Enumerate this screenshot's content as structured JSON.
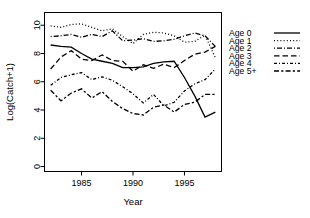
{
  "chart_data": {
    "type": "line",
    "title": "",
    "xlabel": "Year",
    "ylabel": "Log(Catch+1)",
    "xlim": [
      1981.4,
      1998.6
    ],
    "ylim": [
      -0.35,
      10.9
    ],
    "xticks": [
      1985,
      1990,
      1995
    ],
    "xtick_labels": [
      "1985",
      "1990",
      "1995"
    ],
    "yticks": [
      0,
      2,
      4,
      6,
      8,
      10
    ],
    "ytick_labels": [
      "0",
      "2",
      "4",
      "6",
      "8",
      "10"
    ],
    "grid": false,
    "legend_position": "right",
    "x": [
      1982,
      1983,
      1984,
      1985,
      1986,
      1987,
      1988,
      1989,
      1990,
      1991,
      1992,
      1993,
      1994,
      1995,
      1996,
      1997,
      1998
    ],
    "series": [
      {
        "name": "Age 0",
        "dash": "solid",
        "values": [
          8.6,
          8.5,
          8.45,
          8.0,
          7.6,
          7.45,
          7.3,
          7.0,
          7.0,
          7.05,
          7.3,
          7.4,
          7.45,
          6.3,
          5.0,
          3.5,
          3.85
        ]
      },
      {
        "name": "Age 1",
        "dash": "dotted",
        "values": [
          9.95,
          9.85,
          10.05,
          10.1,
          9.85,
          9.6,
          9.75,
          9.2,
          8.7,
          9.35,
          9.5,
          9.45,
          9.25,
          8.8,
          8.85,
          9.3,
          7.7
        ]
      },
      {
        "name": "Age 2",
        "dash": "dashdot",
        "values": [
          9.2,
          9.25,
          9.35,
          9.15,
          9.35,
          9.2,
          9.6,
          8.9,
          8.95,
          9.05,
          8.85,
          8.9,
          9.0,
          9.25,
          9.45,
          9.25,
          8.5
        ]
      },
      {
        "name": "Age 3",
        "dash": "dashed",
        "values": [
          6.9,
          7.75,
          8.2,
          7.6,
          7.5,
          7.9,
          7.5,
          7.45,
          6.75,
          7.2,
          6.95,
          7.25,
          7.0,
          7.5,
          7.95,
          8.1,
          8.5
        ]
      },
      {
        "name": "Age 4",
        "dash": "finedash",
        "values": [
          5.75,
          6.3,
          6.5,
          6.65,
          6.15,
          6.35,
          6.1,
          5.65,
          5.15,
          4.5,
          5.1,
          4.3,
          4.55,
          5.35,
          5.85,
          6.15,
          6.9
        ]
      },
      {
        "name": "Age 5+",
        "dash": "longdashdot",
        "values": [
          5.4,
          4.65,
          5.2,
          5.5,
          4.85,
          5.3,
          4.6,
          4.1,
          3.75,
          3.65,
          4.2,
          4.35,
          3.85,
          4.4,
          4.55,
          5.1,
          5.1
        ]
      }
    ]
  },
  "legend": {
    "entries": [
      {
        "label": "Age 0"
      },
      {
        "label": "Age 1"
      },
      {
        "label": "Age 2"
      },
      {
        "label": "Age 3"
      },
      {
        "label": "Age 4"
      },
      {
        "label": "Age 5+"
      }
    ]
  },
  "style": {
    "line_color": "#000000",
    "background": "#ffffff"
  }
}
